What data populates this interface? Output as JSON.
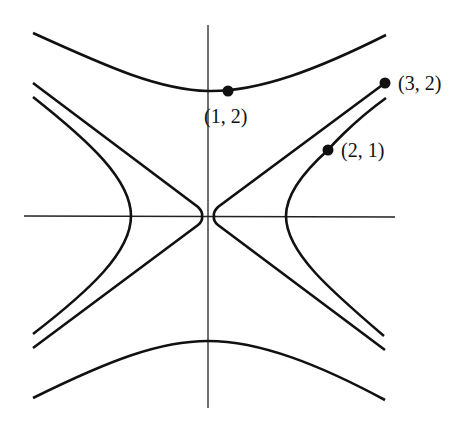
{
  "diagram": {
    "type": "hyperbola-family",
    "colors": {
      "stroke": "#111111",
      "axis": "#222222",
      "background": "#ffffff"
    },
    "points": [
      {
        "id": "p12",
        "label": "(1, 2)",
        "x": 228,
        "y": 91,
        "label_x": 204,
        "label_y": 106
      },
      {
        "id": "p32",
        "label": "(3, 2)",
        "x": 385,
        "y": 83,
        "label_x": 398,
        "label_y": 73
      },
      {
        "id": "p21",
        "label": "(2, 1)",
        "x": 328,
        "y": 150,
        "label_x": 341,
        "label_y": 140
      }
    ]
  }
}
